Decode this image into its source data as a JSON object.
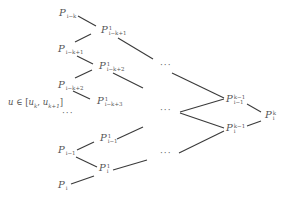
{
  "diagram": {
    "title": "",
    "type": "interpolation-tree",
    "range_label": {
      "var": "u",
      "symbol": "∈",
      "text": "u ∈ [u_k, u_{k+1}]",
      "open": "[",
      "u1": "u",
      "u1_sub": "k",
      "sep": ", ",
      "u2": "u",
      "u2_sub": "k+1",
      "close": "]"
    },
    "ellipsis": "···",
    "nodes": [
      {
        "id": "p_i-k",
        "base": "P",
        "sup": "",
        "sub": "i−k"
      },
      {
        "id": "p_i-k+1",
        "base": "P",
        "sup": "",
        "sub": "i−k+1"
      },
      {
        "id": "p_i-k+2",
        "base": "P",
        "sup": "",
        "sub": "i−k+2"
      },
      {
        "id": "p_i-1",
        "base": "P",
        "sup": "",
        "sub": "i−1"
      },
      {
        "id": "p_i",
        "base": "P",
        "sup": "",
        "sub": "i"
      },
      {
        "id": "p1_i-k+1",
        "base": "P",
        "sup": "1",
        "sub": "i−k+1"
      },
      {
        "id": "p1_i-k+2",
        "base": "P",
        "sup": "1",
        "sub": "i−k+2"
      },
      {
        "id": "p1_i-k+3",
        "base": "P",
        "sup": "1",
        "sub": "i−k+3"
      },
      {
        "id": "p1_i-1",
        "base": "P",
        "sup": "1",
        "sub": "i−1"
      },
      {
        "id": "p1_i",
        "base": "P",
        "sup": "1",
        "sub": "i"
      },
      {
        "id": "pk-1_i-1",
        "base": "P",
        "sup": "k−1",
        "sub": "i−1"
      },
      {
        "id": "pk-1_i",
        "base": "P",
        "sup": "k−1",
        "sub": "i"
      },
      {
        "id": "pk_i",
        "base": "P",
        "sup": "k",
        "sub": "i"
      }
    ],
    "edges": [
      [
        "p_i-k",
        "p1_i-k+1"
      ],
      [
        "p_i-k+1",
        "p1_i-k+1"
      ],
      [
        "p_i-k+1",
        "p1_i-k+2"
      ],
      [
        "p_i-k+2",
        "p1_i-k+2"
      ],
      [
        "p_i-k+2",
        "p1_i-k+3"
      ],
      [
        "p_i-1",
        "p1_i-1"
      ],
      [
        "p_i-1",
        "p1_i"
      ],
      [
        "p_i",
        "p1_i"
      ],
      [
        "p1_i-k+1",
        "…top"
      ],
      [
        "p1_i-k+2",
        "…mid"
      ],
      [
        "p1_i-1",
        "…mid"
      ],
      [
        "p1_i",
        "…bottom"
      ],
      [
        "…top",
        "pk-1_i-1"
      ],
      [
        "…mid",
        "pk-1_i-1"
      ],
      [
        "…mid",
        "pk-1_i"
      ],
      [
        "…bottom",
        "pk-1_i"
      ],
      [
        "pk-1_i-1",
        "pk_i"
      ],
      [
        "pk-1_i",
        "pk_i"
      ]
    ]
  }
}
